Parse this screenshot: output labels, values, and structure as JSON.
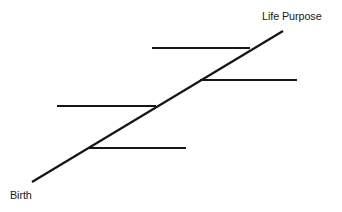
{
  "canvas": {
    "width": 342,
    "height": 212,
    "background_color": "#ffffff"
  },
  "style": {
    "line_color": "#161616",
    "line_width": 2.2,
    "rung_width": 2.2,
    "text_color": "#1a1a1a"
  },
  "labels": {
    "start": "Birth",
    "end": "Life Purpose"
  },
  "chart_data": {
    "type": "line",
    "title": "",
    "xlabel": "",
    "ylabel": "",
    "annotations": [
      "Birth",
      "Life Purpose"
    ],
    "main_line": {
      "name": "life-path",
      "x": [
        32,
        283
      ],
      "y": [
        182,
        31
      ]
    },
    "rungs": [
      {
        "name": "rung-1",
        "x1": 152,
        "x2": 250,
        "y": 48,
        "side": "left"
      },
      {
        "name": "rung-2",
        "x1": 200,
        "x2": 297,
        "y": 80,
        "side": "right"
      },
      {
        "name": "rung-3",
        "x1": 57,
        "x2": 156,
        "y": 106,
        "side": "left"
      },
      {
        "name": "rung-4",
        "x1": 88,
        "x2": 186,
        "y": 148,
        "side": "right"
      }
    ]
  }
}
